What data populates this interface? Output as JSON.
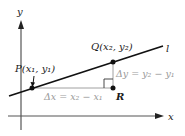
{
  "diagram": {
    "axes": {
      "x_label": "x",
      "y_label": "y"
    },
    "line": {
      "label": "l"
    },
    "points": {
      "P": {
        "name": "P",
        "label": "P(x₁, y₁)"
      },
      "Q": {
        "name": "Q",
        "label": "Q(x₂, y₂)"
      },
      "R": {
        "name": "R",
        "label": "R"
      }
    },
    "annotations": {
      "delta_x": "Δx = x₂ − x₁",
      "delta_y": "Δy = y₂ − y₁"
    },
    "colors": {
      "axis": "#555555",
      "line": "#111111",
      "guides": "#a0a0a0",
      "annotation_text": "#9a9a9a"
    }
  }
}
